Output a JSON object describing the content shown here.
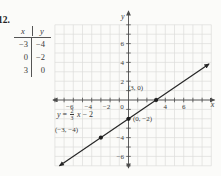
{
  "problem_number": "12.",
  "colors": {
    "background": "#fbfbf9",
    "grid": "#dddddb",
    "axis": "#4c4c4c",
    "text": "#3a3a3a",
    "line": "#262626",
    "point": "#1e1e1e"
  },
  "table": {
    "headers": [
      "x",
      "y"
    ],
    "rows": [
      [
        "−3",
        "−4"
      ],
      [
        "0",
        "−2"
      ],
      [
        "3",
        "0"
      ]
    ]
  },
  "chart_data": {
    "type": "line",
    "title": "",
    "equation_label": "y = 2/3 x − 2",
    "equation_parts": {
      "lhs": "y",
      "eq": "=",
      "num": "2",
      "den": "3",
      "var": "x",
      "rest": "− 2"
    },
    "slope_num": 2,
    "slope_den": 3,
    "intercept": -2,
    "xlabel": "x",
    "ylabel": "y",
    "xlim": [
      -8,
      9
    ],
    "ylim": [
      -7,
      8
    ],
    "grid": true,
    "x_tick_labels": [
      -6,
      -4,
      -2,
      0,
      4,
      6
    ],
    "y_tick_labels": [
      6,
      4,
      2,
      -4,
      -6
    ],
    "line_x_range": [
      -7.5,
      8.75
    ],
    "points": [
      {
        "x": 3,
        "y": 0,
        "label": "(3, 0)"
      },
      {
        "x": 0,
        "y": -2,
        "label": "(0, −2)"
      },
      {
        "x": -3,
        "y": -4,
        "label": "(−3, −4)"
      }
    ]
  }
}
